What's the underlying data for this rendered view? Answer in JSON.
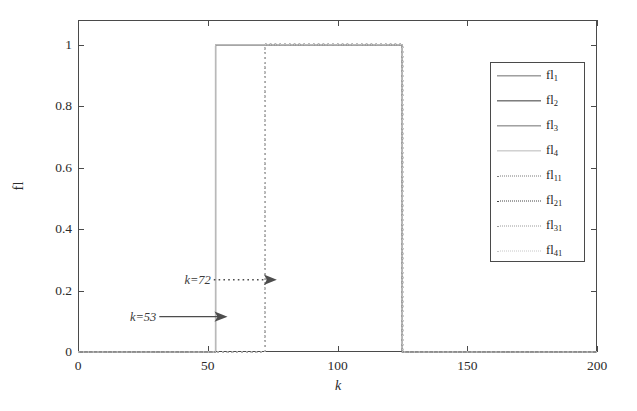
{
  "chart_data": {
    "type": "line",
    "title": "",
    "subtitle": "",
    "xlabel": "k",
    "ylabel": "fl",
    "xlim": [
      0,
      200
    ],
    "ylim": [
      0,
      1.08
    ],
    "xticks": [
      0,
      50,
      100,
      150,
      200
    ],
    "xticklabels": [
      "0",
      "50",
      "100",
      "150",
      "200"
    ],
    "yticks": [
      0,
      0.2,
      0.4,
      0.6,
      0.8,
      1
    ],
    "yticklabels": [
      "0",
      "0.2",
      "0.4",
      "0.6",
      "0.8",
      "1"
    ],
    "grid": false,
    "legend_position": "upper right",
    "series": [
      {
        "name": "fl1",
        "style": "solid",
        "rise_k": 53,
        "fall_k": 125,
        "low": 0,
        "high": 1,
        "color": "#6e6e6e"
      },
      {
        "name": "fl2",
        "style": "solid",
        "rise_k": 53,
        "fall_k": 125,
        "low": 0,
        "high": 1,
        "color": "#3a3a3a"
      },
      {
        "name": "fl3",
        "style": "solid",
        "rise_k": 53,
        "fall_k": 125,
        "low": 0,
        "high": 1,
        "color": "#707070"
      },
      {
        "name": "fl4",
        "style": "solid",
        "rise_k": 53,
        "fall_k": 125,
        "low": 0,
        "high": 1,
        "color": "#b9b9b9"
      },
      {
        "name": "fl11",
        "style": "dotted",
        "rise_k": 72,
        "fall_k": 125,
        "low": 0,
        "high": 1,
        "color": "#7a7a7a"
      },
      {
        "name": "fl21",
        "style": "dotted",
        "rise_k": 72,
        "fall_k": 125,
        "low": 0,
        "high": 1,
        "color": "#444444"
      },
      {
        "name": "fl31",
        "style": "dotted",
        "rise_k": 72,
        "fall_k": 125,
        "low": 0,
        "high": 1,
        "color": "#9a9a9a"
      },
      {
        "name": "fl41",
        "style": "dotted",
        "rise_k": 72,
        "fall_k": 125,
        "low": 0,
        "high": 1,
        "color": "#c6c6c6"
      }
    ],
    "annotations": [
      {
        "text": "k=53",
        "points_to_k": 53,
        "points_to_y": 0.115,
        "arrow": "solid",
        "text_k": 20
      },
      {
        "text": "k=72",
        "points_to_k": 72,
        "points_to_y": 0.235,
        "arrow": "dotted",
        "text_k": 41
      }
    ]
  },
  "legend": {
    "entries": [
      {
        "base": "fl",
        "sub": "1"
      },
      {
        "base": "fl",
        "sub": "2"
      },
      {
        "base": "fl",
        "sub": "3"
      },
      {
        "base": "fl",
        "sub": "4"
      },
      {
        "base": "fl",
        "sub": "11"
      },
      {
        "base": "fl",
        "sub": "21"
      },
      {
        "base": "fl",
        "sub": "31"
      },
      {
        "base": "fl",
        "sub": "41"
      }
    ]
  }
}
